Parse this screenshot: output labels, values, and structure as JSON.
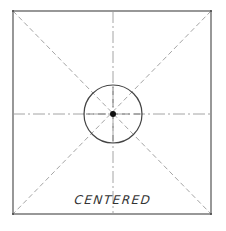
{
  "diagram": {
    "title": "",
    "label": "CENTERED",
    "colors": {
      "outline": "#444444",
      "guides": "#9a9a9a",
      "dot": "#111111",
      "background": "#ffffff"
    },
    "square": {
      "x1": 13,
      "y1": 11,
      "x2": 211,
      "y2": 214
    },
    "center": {
      "x": 113,
      "y": 114
    },
    "circle": {
      "radius": 29
    },
    "dot": {
      "radius": 3
    }
  }
}
